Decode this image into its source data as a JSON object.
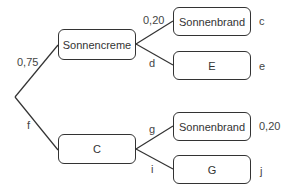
{
  "diagram": {
    "type": "probability-tree",
    "root": {
      "x": 15,
      "y": 97
    },
    "level1": [
      {
        "id": "n1",
        "label": "Sonnencreme",
        "branch_label": "0,75"
      },
      {
        "id": "n2",
        "label": "C",
        "branch_label": "f"
      }
    ],
    "level2": [
      {
        "id": "n11",
        "parent": "n1",
        "label": "Sonnenbrand",
        "branch_label": "0,20",
        "end_label": "c"
      },
      {
        "id": "n12",
        "parent": "n1",
        "label": "E",
        "branch_label": "d",
        "end_label": "e"
      },
      {
        "id": "n21",
        "parent": "n2",
        "label": "Sonnenbrand",
        "branch_label": "g",
        "end_label": "0,20"
      },
      {
        "id": "n22",
        "parent": "n2",
        "label": "G",
        "branch_label": "i",
        "end_label": "j"
      }
    ],
    "colors": {
      "line": "#333333",
      "text": "#333333",
      "background": "#ffffff"
    }
  }
}
